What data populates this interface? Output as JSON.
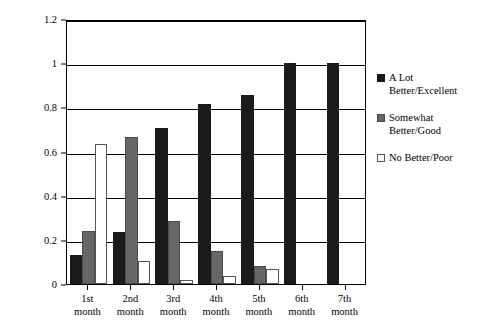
{
  "chart_data": {
    "type": "bar",
    "title": "",
    "xlabel": "",
    "ylabel": "",
    "ylim": [
      0,
      1.2
    ],
    "yticks": [
      "0",
      "0.2",
      "0.4",
      "0.6",
      "0.8",
      "1",
      "1.2"
    ],
    "ytick_values": [
      0,
      0.2,
      0.4,
      0.6,
      0.8,
      1,
      1.2
    ],
    "grid": true,
    "legend_position": "right",
    "categories": [
      "1st month",
      "2nd month",
      "3rd month",
      "4th month",
      "5th month",
      "6th month",
      "7th month"
    ],
    "category_lines": [
      [
        "1st",
        "month"
      ],
      [
        "2nd",
        "month"
      ],
      [
        "3rd",
        "month"
      ],
      [
        "4th",
        "month"
      ],
      [
        "5th",
        "month"
      ],
      [
        "6th",
        "month"
      ],
      [
        "7th",
        "month"
      ]
    ],
    "series": [
      {
        "name": "A Lot Better/Excellent",
        "name_lines": [
          "A Lot",
          "Better/Excellent"
        ],
        "color": "#1a1a1a",
        "values": [
          0.13,
          0.235,
          0.705,
          0.815,
          0.855,
          1.0,
          1.0
        ]
      },
      {
        "name": "Somewhat Better/Good",
        "name_lines": [
          "Somewhat",
          "Better/Good"
        ],
        "color": "#666666",
        "values": [
          0.24,
          0.665,
          0.285,
          0.15,
          0.08,
          0,
          0
        ]
      },
      {
        "name": "No Better/Poor",
        "name_lines": [
          "No Better/Poor"
        ],
        "color": "#ffffff",
        "values": [
          0.635,
          0.105,
          0.02,
          0.035,
          0.07,
          0,
          0
        ]
      }
    ]
  }
}
